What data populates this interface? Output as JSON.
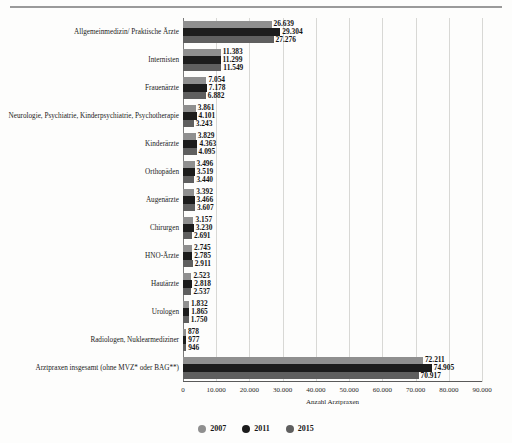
{
  "chart_data": {
    "type": "bar",
    "orientation": "horizontal",
    "title": "",
    "xlabel": "Anzahl Arztpraxen",
    "ylabel": "",
    "xlim": [
      0,
      90000
    ],
    "grid": true,
    "legend_position": "bottom",
    "xticks": [
      "0",
      "10.000",
      "20.000",
      "30.000",
      "40.000",
      "50.000",
      "60.000",
      "70.000",
      "80.000",
      "90.000"
    ],
    "categories": [
      "Allgemeinmedizin/ Praktische Ärzte",
      "Internisten",
      "Frauenärzte",
      "Neurologie, Psychiatrie, Kinderpsychiatrie, Psychotherapie",
      "Kinderärzte",
      "Orthopäden",
      "Augenärzte",
      "Chirurgen",
      "HNO-Ärzte",
      "Hautärzte",
      "Urologen",
      "Radiologen, Nuklearmediziner",
      "Arztpraxen insgesamt (ohne MVZ* oder BAG**)"
    ],
    "series": [
      {
        "name": "2007",
        "color": "#8f8f8f",
        "values": [
          26639,
          11383,
          7054,
          3861,
          3829,
          3496,
          3392,
          3157,
          2745,
          2523,
          1832,
          878,
          72211
        ],
        "labels": [
          "26.639",
          "11.383",
          "7.054",
          "3.861",
          "3.829",
          "3.496",
          "3.392",
          "3.157",
          "2.745",
          "2.523",
          "1.832",
          "878",
          "72.211"
        ]
      },
      {
        "name": "2011",
        "color": "#1c1c1c",
        "values": [
          29304,
          11299,
          7178,
          4101,
          4363,
          3519,
          3466,
          3230,
          2785,
          2818,
          1865,
          977,
          74905
        ],
        "labels": [
          "29.304",
          "11.299",
          "7.178",
          "4.101",
          "4.363",
          "3.519",
          "3.466",
          "3.230",
          "2.785",
          "2.818",
          "1.865",
          "977",
          "74.905"
        ]
      },
      {
        "name": "2015",
        "color": "#5f5f5f",
        "values": [
          27276,
          11549,
          6882,
          3243,
          4095,
          3440,
          3607,
          2691,
          2911,
          2537,
          1750,
          946,
          70917
        ],
        "labels": [
          "27.276",
          "11.549",
          "6.882",
          "3.243",
          "4.095",
          "3.440",
          "3.607",
          "2.691",
          "2.911",
          "2.537",
          "1.750",
          "946",
          "70.917"
        ]
      }
    ]
  },
  "legend": {
    "items": [
      {
        "label": "2007",
        "color": "#8f8f8f"
      },
      {
        "label": "2011",
        "color": "#1c1c1c"
      },
      {
        "label": "2015",
        "color": "#5f5f5f"
      }
    ]
  }
}
